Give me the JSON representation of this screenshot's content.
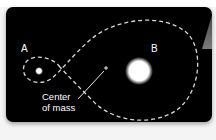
{
  "diagram": {
    "bodies": [
      {
        "id": "A",
        "label": "A",
        "size": "small",
        "color": "#ffffff"
      },
      {
        "id": "B",
        "label": "B",
        "size": "large",
        "color": "#ffffff"
      }
    ],
    "center_of_mass": {
      "marker": "+",
      "label_line1": "Center",
      "label_line2": "of mass"
    },
    "orbit": {
      "style": "dashed",
      "color": "#d9d9d9"
    },
    "background_color": "#000000"
  }
}
